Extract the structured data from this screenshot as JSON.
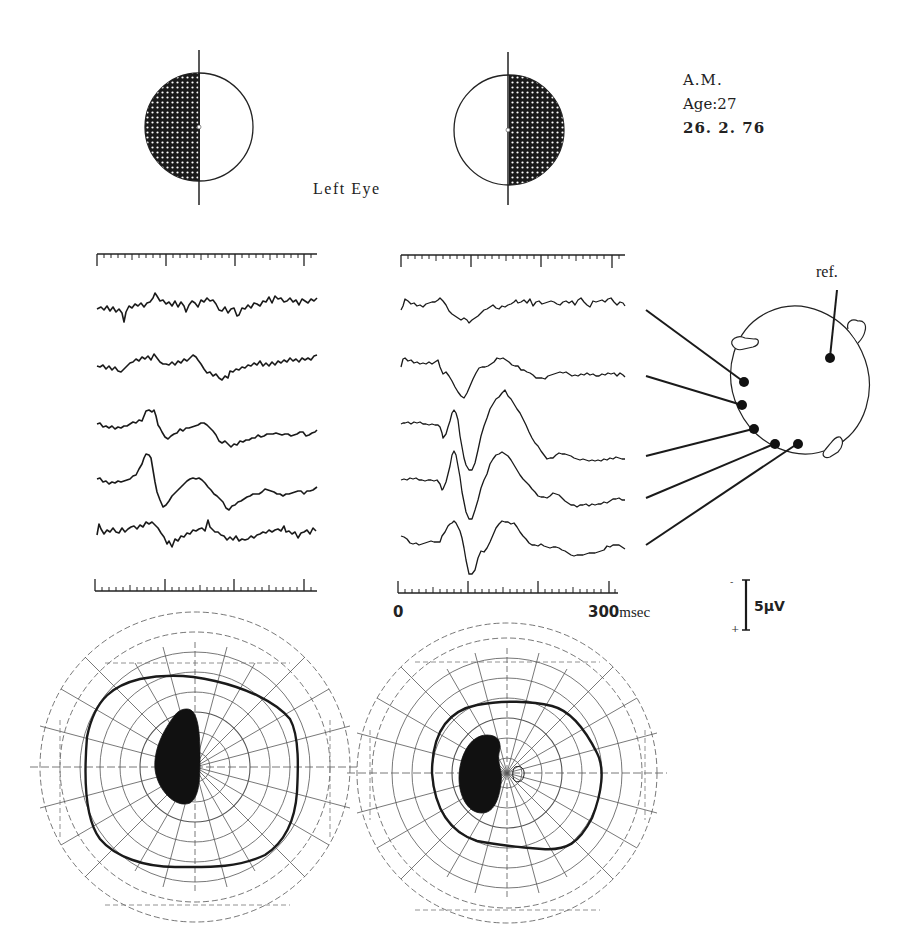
{
  "patient": {
    "initials": "A.M.",
    "age_line": "Age:27",
    "date": "26. 2. 76"
  },
  "stimulus": {
    "eye_label": "Left Eye",
    "fields": [
      {
        "name": "left-half-field",
        "shaded_half": "left"
      },
      {
        "name": "right-half-field",
        "shaded_half": "right"
      }
    ]
  },
  "traces": {
    "time_axis": {
      "start_label": "0",
      "end_label": "300",
      "unit": "msec"
    },
    "amplitude_scale": {
      "label": "5μV",
      "minus": "-",
      "plus": "+"
    },
    "columns": [
      {
        "name": "left-half-field-responses",
        "channel_count": 5
      },
      {
        "name": "right-half-field-responses",
        "channel_count": 5
      }
    ]
  },
  "head_diagram": {
    "reference_label": "ref.",
    "electrode_count": 5
  },
  "perimetry": {
    "charts": [
      {
        "name": "visual-field-left",
        "angle_labels": [
          "135",
          "120",
          "105",
          "90",
          "75",
          "60",
          "45",
          "30",
          "15",
          "0",
          "345",
          "330",
          "315",
          "300",
          "285",
          "270",
          "255",
          "240",
          "225",
          "210",
          "195",
          "180",
          "165",
          "150"
        ]
      },
      {
        "name": "visual-field-right",
        "angle_labels": [
          "135",
          "120",
          "105",
          "90",
          "75",
          "60",
          "45",
          "30",
          "15",
          "0",
          "345",
          "330",
          "315",
          "300",
          "285",
          "270",
          "255",
          "240",
          "225",
          "210",
          "195",
          "180",
          "165",
          "150"
        ]
      }
    ]
  },
  "colors": {
    "ink": "#1a1a1a",
    "grid": "#555555",
    "background": "#ffffff"
  }
}
